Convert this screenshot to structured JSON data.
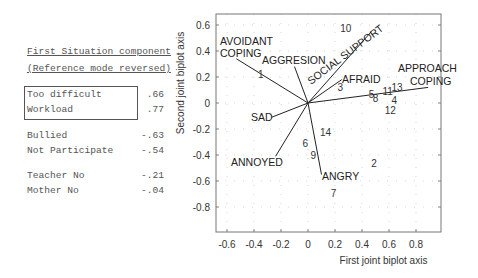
{
  "legend": {
    "title_line1": "First Situation component",
    "title_line2": "(Reference mode reversed)",
    "boxed": [
      {
        "label": "Too difficult",
        "value": ".66"
      },
      {
        "label": "Workload",
        "value": ".77"
      }
    ],
    "group2": [
      {
        "label": "Bullied",
        "value": "-.63"
      },
      {
        "label": "Not Participate",
        "value": "-.54"
      }
    ],
    "group3": [
      {
        "label": "Teacher No",
        "value": "-.21"
      },
      {
        "label": "Mother No",
        "value": "-.04"
      }
    ]
  },
  "chart_data": {
    "type": "scatter",
    "title": "",
    "xlabel": "First joint biplot axis",
    "ylabel": "Second joint biplot axis",
    "xlim": [
      -0.68,
      1.0
    ],
    "ylim": [
      -0.99,
      0.68
    ],
    "xticks": [
      "-0.6",
      "-0.4",
      "-0.2",
      "0",
      "0.2",
      "0.4",
      "0.6",
      "0.8"
    ],
    "yticks": [
      "0.6",
      "0.4",
      "0.2",
      "0",
      "-0.2",
      "-0.4",
      "-0.6",
      "-0.8"
    ],
    "grid": "dotted",
    "vectors": [
      {
        "name": "AVOIDANT COPING",
        "x": -0.53,
        "y": 0.34
      },
      {
        "name": "AGGRESION",
        "x": -0.1,
        "y": 0.28
      },
      {
        "name": "SOCIAL SUPPORT",
        "x": 0.47,
        "y": 0.55
      },
      {
        "name": "AFRAID",
        "x": 0.25,
        "y": 0.18
      },
      {
        "name": "APPROACH COPING",
        "x": 0.89,
        "y": 0.12
      },
      {
        "name": "SAD",
        "x": -0.27,
        "y": -0.11
      },
      {
        "name": "ANNOYED",
        "x": -0.24,
        "y": -0.41
      },
      {
        "name": "ANGRY",
        "x": 0.1,
        "y": -0.55
      }
    ],
    "points": [
      {
        "label": "1",
        "x": -0.35,
        "y": 0.22
      },
      {
        "label": "2",
        "x": 0.49,
        "y": -0.46
      },
      {
        "label": "3",
        "x": 0.24,
        "y": 0.12
      },
      {
        "label": "4",
        "x": 0.64,
        "y": 0.02
      },
      {
        "label": "5",
        "x": 0.47,
        "y": 0.07
      },
      {
        "label": "6",
        "x": -0.02,
        "y": -0.31
      },
      {
        "label": "7",
        "x": 0.19,
        "y": -0.69
      },
      {
        "label": "8",
        "x": 0.5,
        "y": 0.04
      },
      {
        "label": "9",
        "x": 0.04,
        "y": -0.4
      },
      {
        "label": "10",
        "x": 0.28,
        "y": 0.58
      },
      {
        "label": "11",
        "x": 0.59,
        "y": 0.09
      },
      {
        "label": "12",
        "x": 0.61,
        "y": -0.05
      },
      {
        "label": "13",
        "x": 0.66,
        "y": 0.12
      },
      {
        "label": "14",
        "x": 0.13,
        "y": -0.22
      }
    ]
  }
}
